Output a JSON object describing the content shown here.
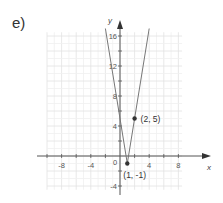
{
  "problem_label": "e)",
  "chart_data": {
    "type": "line",
    "title": "",
    "equation_implied": "y = 6|x - 1| - 1",
    "xlabel": "x",
    "ylabel": "y",
    "xlim": [
      -10,
      8.5
    ],
    "ylim": [
      -4.5,
      17
    ],
    "grid": true,
    "grid_step": 2,
    "x_ticks": [
      -8,
      -4,
      0,
      4,
      8
    ],
    "x_tick_labels": [
      "-8",
      "-4",
      "0",
      "4",
      "8"
    ],
    "y_ticks": [
      -4,
      4,
      8,
      12,
      16
    ],
    "y_tick_labels": [
      "-4",
      "4",
      "8",
      "12",
      "16"
    ],
    "series": [
      {
        "name": "absolute value graph",
        "x": [
          -2,
          1,
          4
        ],
        "y": [
          17,
          -1,
          17
        ],
        "color": "#777777"
      }
    ],
    "points": [
      {
        "x": 1,
        "y": -1,
        "label": "(1, -1)"
      },
      {
        "x": 2,
        "y": 5,
        "label": "(2, 5)"
      }
    ]
  }
}
